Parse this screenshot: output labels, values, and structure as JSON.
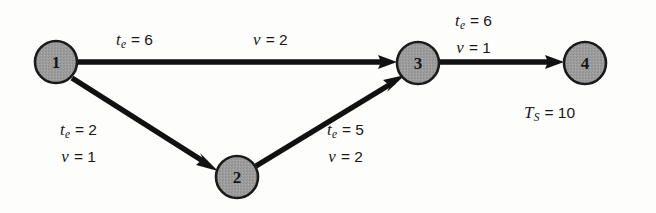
{
  "figure": {
    "type": "directed-activity-network",
    "background_color": "#fdfdfb",
    "node_fill_color": "#9a9a9a",
    "node_stroke_color": "#1a1a1a",
    "edge_color": "#111111"
  },
  "nodes": [
    {
      "id": "1",
      "label": "1",
      "cx": 56,
      "cy": 62,
      "r": 21
    },
    {
      "id": "2",
      "label": "2",
      "cx": 237,
      "cy": 177,
      "r": 21
    },
    {
      "id": "3",
      "label": "3",
      "cx": 418,
      "cy": 63,
      "r": 21
    },
    {
      "id": "4",
      "label": "4",
      "cx": 585,
      "cy": 63,
      "r": 21
    }
  ],
  "edges": [
    {
      "id": "e13",
      "from": "1",
      "to": "3",
      "te_symbol": "t",
      "te_subscript": "e",
      "equals": "=",
      "te_value": "6",
      "v_symbol": "v",
      "v_value": "2"
    },
    {
      "id": "e12",
      "from": "1",
      "to": "2",
      "te_symbol": "t",
      "te_subscript": "e",
      "equals": "=",
      "te_value": "2",
      "v_symbol": "v",
      "v_value": "1"
    },
    {
      "id": "e23",
      "from": "2",
      "to": "3",
      "te_symbol": "t",
      "te_subscript": "e",
      "equals": "=",
      "te_value": "5",
      "v_symbol": "v",
      "v_value": "2"
    },
    {
      "id": "e34",
      "from": "3",
      "to": "4",
      "te_symbol": "t",
      "te_subscript": "e",
      "equals": "=",
      "te_value": "6",
      "v_symbol": "v",
      "v_value": "1"
    }
  ],
  "terminal": {
    "symbol": "T",
    "subscript": "S",
    "equals": "=",
    "value": "10"
  }
}
